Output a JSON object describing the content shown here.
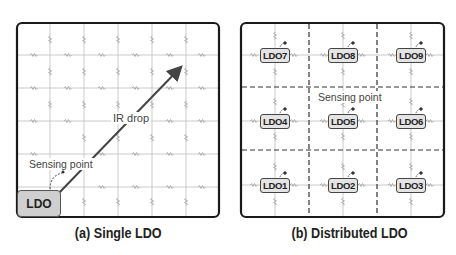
{
  "panel_a": {
    "caption": "(a) Single LDO",
    "ldo_label": "LDO",
    "arrow_label": "IR drop",
    "sensing_label": "Sensing point"
  },
  "panel_b": {
    "caption": "(b) Distributed LDO",
    "sensing_label": "Sensing point",
    "ldos": [
      {
        "label": "LDO7"
      },
      {
        "label": "LDO8"
      },
      {
        "label": "LDO9"
      },
      {
        "label": "LDO4"
      },
      {
        "label": "LDO5"
      },
      {
        "label": "LDO6"
      },
      {
        "label": "LDO1"
      },
      {
        "label": "LDO2"
      },
      {
        "label": "LDO3"
      }
    ]
  },
  "colors": {
    "grid": "#b8b8b8",
    "frame": "#1a1a1a",
    "arrow": "#444444",
    "ldo_fill": "#cfcfcf",
    "dashed": "#333333"
  }
}
